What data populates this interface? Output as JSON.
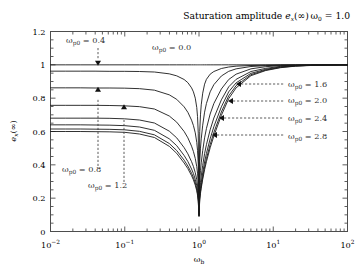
{
  "figure": {
    "title": "Saturation amplitude",
    "title_symbol": "e",
    "title_symbol_sub": "x",
    "title_symbol_arg": "(∞)",
    "corner_note_symbol": "ω",
    "corner_note_sub": "0",
    "corner_note_value": "= 1.0",
    "background": "#ffffff",
    "frame_color": "#4d4d4d",
    "curve_color": "#1a1a1a",
    "annotation_color": "#333333"
  },
  "axes": {
    "x": {
      "label_symbol": "ω",
      "label_sub": "b",
      "scale": "log",
      "min": 0.01,
      "max": 100,
      "ticks": [
        {
          "value": 0.01,
          "mantissa": "10",
          "exponent": "−2"
        },
        {
          "value": 0.1,
          "mantissa": "10",
          "exponent": "−1"
        },
        {
          "value": 1,
          "mantissa": "10",
          "exponent": "0"
        },
        {
          "value": 10,
          "mantissa": "10",
          "exponent": "1"
        },
        {
          "value": 100,
          "mantissa": "10",
          "exponent": "2"
        }
      ]
    },
    "y": {
      "label_symbol": "e",
      "label_sub": "x",
      "label_arg": "(∞)",
      "scale": "linear",
      "min": 0,
      "max": 1.2,
      "ticks": [
        {
          "value": 0,
          "text": "0"
        },
        {
          "value": 0.2,
          "text": "0.2"
        },
        {
          "value": 0.4,
          "text": "0.4"
        },
        {
          "value": 0.6,
          "text": "0.6"
        },
        {
          "value": 0.8,
          "text": "0.8"
        },
        {
          "value": 1.0,
          "text": "1"
        },
        {
          "value": 1.2,
          "text": "1.2"
        }
      ]
    }
  },
  "chart_data": {
    "type": "line",
    "xlabel": "ω_b",
    "ylabel": "e_x(∞)",
    "xscale": "log",
    "xlim": [
      0.01,
      100
    ],
    "ylim": [
      0,
      1.2
    ],
    "grid": false,
    "legend": "inline-annotations",
    "note": "ω_0 = 1.0",
    "x": [
      0.01,
      0.0158,
      0.0251,
      0.0398,
      0.0631,
      0.1,
      0.158,
      0.251,
      0.398,
      0.501,
      0.631,
      0.708,
      0.794,
      0.841,
      0.891,
      0.933,
      0.955,
      0.977,
      1.0,
      1.023,
      1.047,
      1.072,
      1.122,
      1.189,
      1.259,
      1.413,
      1.585,
      2.0,
      2.512,
      3.162,
      5.012,
      7.943,
      12.59,
      19.95,
      31.62,
      50.12,
      100
    ],
    "series": [
      {
        "name": "ω_p0 = 0.0",
        "value": 0.0,
        "values": [
          1.0,
          1.0,
          1.0,
          1.0,
          1.0,
          1.0,
          1.0,
          1.0,
          1.0,
          1.0,
          1.0,
          1.0,
          1.0,
          1.0,
          1.0,
          1.0,
          1.0,
          1.0,
          1.0,
          1.0,
          1.0,
          1.0,
          1.0,
          1.0,
          1.0,
          1.0,
          1.0,
          1.0,
          1.0,
          1.0,
          1.0,
          1.0,
          1.0,
          1.0,
          1.0,
          1.0,
          1.0
        ]
      },
      {
        "name": "ω_p0 = 0.4",
        "value": 0.4,
        "values": [
          0.962,
          0.962,
          0.962,
          0.962,
          0.961,
          0.961,
          0.96,
          0.957,
          0.946,
          0.934,
          0.912,
          0.893,
          0.862,
          0.838,
          0.8,
          0.744,
          0.69,
          0.59,
          0.135,
          0.6,
          0.7,
          0.76,
          0.83,
          0.884,
          0.913,
          0.944,
          0.96,
          0.978,
          0.987,
          0.992,
          0.996,
          0.998,
          0.999,
          0.999,
          1.0,
          1.0,
          1.0
        ]
      },
      {
        "name": "ω_p0 = 0.8",
        "value": 0.8,
        "values": [
          0.862,
          0.862,
          0.862,
          0.861,
          0.861,
          0.86,
          0.857,
          0.848,
          0.82,
          0.793,
          0.748,
          0.715,
          0.668,
          0.636,
          0.592,
          0.535,
          0.487,
          0.405,
          0.118,
          0.42,
          0.5,
          0.556,
          0.638,
          0.716,
          0.768,
          0.838,
          0.881,
          0.933,
          0.961,
          0.976,
          0.99,
          0.995,
          0.998,
          0.999,
          0.999,
          1.0,
          1.0
        ]
      },
      {
        "name": "ω_p0 = 1.2",
        "value": 1.2,
        "values": [
          0.757,
          0.757,
          0.757,
          0.757,
          0.756,
          0.754,
          0.749,
          0.735,
          0.693,
          0.656,
          0.6,
          0.562,
          0.512,
          0.48,
          0.438,
          0.389,
          0.35,
          0.291,
          0.108,
          0.305,
          0.366,
          0.412,
          0.485,
          0.562,
          0.618,
          0.705,
          0.768,
          0.855,
          0.912,
          0.944,
          0.976,
          0.989,
          0.995,
          0.998,
          0.999,
          0.999,
          1.0
        ]
      },
      {
        "name": "ω_p0 = 1.6",
        "value": 1.6,
        "values": [
          0.68,
          0.68,
          0.68,
          0.68,
          0.679,
          0.676,
          0.669,
          0.651,
          0.602,
          0.562,
          0.503,
          0.466,
          0.419,
          0.39,
          0.353,
          0.311,
          0.279,
          0.232,
          0.1,
          0.244,
          0.294,
          0.333,
          0.397,
          0.467,
          0.521,
          0.61,
          0.681,
          0.79,
          0.868,
          0.913,
          0.96,
          0.979,
          0.991,
          0.996,
          0.998,
          0.999,
          1.0
        ]
      },
      {
        "name": "ω_p0 = 2.0",
        "value": 2.0,
        "values": [
          0.64,
          0.64,
          0.64,
          0.639,
          0.638,
          0.635,
          0.627,
          0.607,
          0.556,
          0.515,
          0.456,
          0.42,
          0.375,
          0.348,
          0.313,
          0.275,
          0.246,
          0.205,
          0.095,
          0.215,
          0.259,
          0.294,
          0.352,
          0.417,
          0.468,
          0.556,
          0.629,
          0.748,
          0.838,
          0.892,
          0.949,
          0.973,
          0.988,
          0.994,
          0.997,
          0.999,
          1.0
        ]
      },
      {
        "name": "ω_p0 = 2.4",
        "value": 2.4,
        "values": [
          0.615,
          0.615,
          0.615,
          0.614,
          0.613,
          0.61,
          0.601,
          0.58,
          0.528,
          0.486,
          0.428,
          0.393,
          0.35,
          0.324,
          0.291,
          0.255,
          0.228,
          0.19,
          0.092,
          0.199,
          0.24,
          0.272,
          0.327,
          0.388,
          0.437,
          0.522,
          0.594,
          0.717,
          0.814,
          0.875,
          0.941,
          0.969,
          0.985,
          0.993,
          0.997,
          0.998,
          1.0
        ]
      },
      {
        "name": "ω_p0 = 2.8",
        "value": 2.8,
        "values": [
          0.6,
          0.6,
          0.6,
          0.599,
          0.598,
          0.595,
          0.585,
          0.564,
          0.511,
          0.469,
          0.411,
          0.377,
          0.335,
          0.31,
          0.278,
          0.244,
          0.218,
          0.182,
          0.09,
          0.19,
          0.229,
          0.26,
          0.313,
          0.371,
          0.419,
          0.502,
          0.573,
          0.697,
          0.797,
          0.862,
          0.935,
          0.966,
          0.983,
          0.992,
          0.996,
          0.998,
          1.0
        ]
      }
    ],
    "annotations": [
      {
        "id": "wp0-00",
        "symbol": "ω",
        "sub": "p0",
        "text": "= 0.0",
        "label": "ω_p0 = 0.0",
        "x_px": 152,
        "y_px": 50,
        "marker": "none"
      },
      {
        "id": "wp0-04",
        "symbol": "ω",
        "sub": "p0",
        "text": "= 0.4",
        "label": "ω_p0 = 0.4",
        "x_px": 66,
        "y_px": 43,
        "marker": "arrow-down"
      },
      {
        "id": "wp0-08",
        "symbol": "ω",
        "sub": "p0",
        "text": "= 0.8",
        "label": "ω_p0 = 0.8",
        "x_px": 62,
        "y_px": 172,
        "marker": "arrow-up"
      },
      {
        "id": "wp0-12",
        "symbol": "ω",
        "sub": "p0",
        "text": "= 1.2",
        "label": "ω_p0 = 1.2",
        "x_px": 88,
        "y_px": 188,
        "marker": "arrow-up"
      },
      {
        "id": "wp0-16",
        "symbol": "ω",
        "sub": "p0",
        "text": "= 1.6",
        "label": "ω_p0 = 1.6",
        "x_px": 288,
        "y_px": 84,
        "marker": "arrow-left"
      },
      {
        "id": "wp0-20",
        "symbol": "ω",
        "sub": "p0",
        "text": "= 2.0",
        "label": "ω_p0 = 2.0",
        "x_px": 288,
        "y_px": 100,
        "marker": "arrow-left"
      },
      {
        "id": "wp0-24",
        "symbol": "ω",
        "sub": "p0",
        "text": "= 2.4",
        "label": "ω_p0 = 2.4",
        "x_px": 288,
        "y_px": 118,
        "marker": "arrow-left"
      },
      {
        "id": "wp0-28",
        "symbol": "ω",
        "sub": "p0",
        "text": "= 2.8",
        "label": "ω_p0 = 2.8",
        "x_px": 288,
        "y_px": 136,
        "marker": "arrow-left"
      }
    ]
  }
}
